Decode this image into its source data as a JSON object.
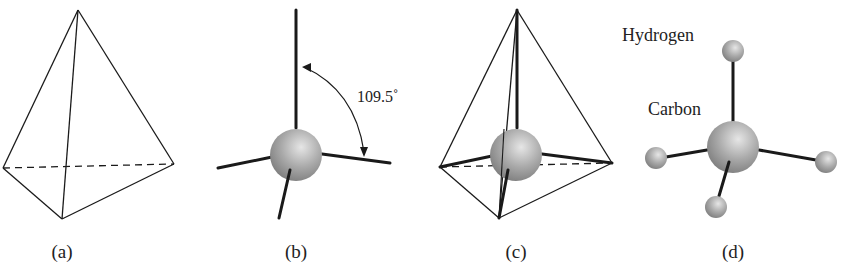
{
  "figure": {
    "panels": [
      {
        "id": "a",
        "caption": "(a)",
        "description": "tetrahedron wireframe"
      },
      {
        "id": "b",
        "caption": "(b)",
        "description": "central atom with four bonds",
        "angle_label": "109.5˚"
      },
      {
        "id": "c",
        "caption": "(c)",
        "description": "atom with bonds inscribed in tetrahedron"
      },
      {
        "id": "d",
        "caption": "(d)",
        "description": "methane ball-and-stick model",
        "labels": {
          "hydrogen": "Hydrogen",
          "carbon": "Carbon"
        }
      }
    ],
    "colors": {
      "line": "#1a1a1a",
      "sphere": "#a8a8a8",
      "background": "#ffffff"
    }
  }
}
